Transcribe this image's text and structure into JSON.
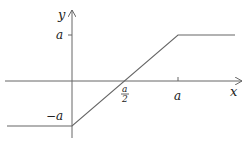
{
  "diagram": {
    "title": "",
    "axes": {
      "x_label": "x",
      "y_label": "y",
      "line_color": "#666666"
    },
    "ticks": {
      "y_a": "a",
      "y_neg_a": "−a",
      "x_half_num": "a",
      "x_half_den": "2",
      "x_a": "a"
    },
    "curve": {
      "description": "piecewise linear: constant −a for x<0, linear from (0,−a) to (a,a), constant a for x>a",
      "color": "#666666",
      "points": [
        [
          -1,
          -1
        ],
        [
          0,
          -1
        ],
        [
          0.5,
          0
        ],
        [
          1,
          1
        ],
        [
          1.5,
          1
        ]
      ]
    }
  }
}
